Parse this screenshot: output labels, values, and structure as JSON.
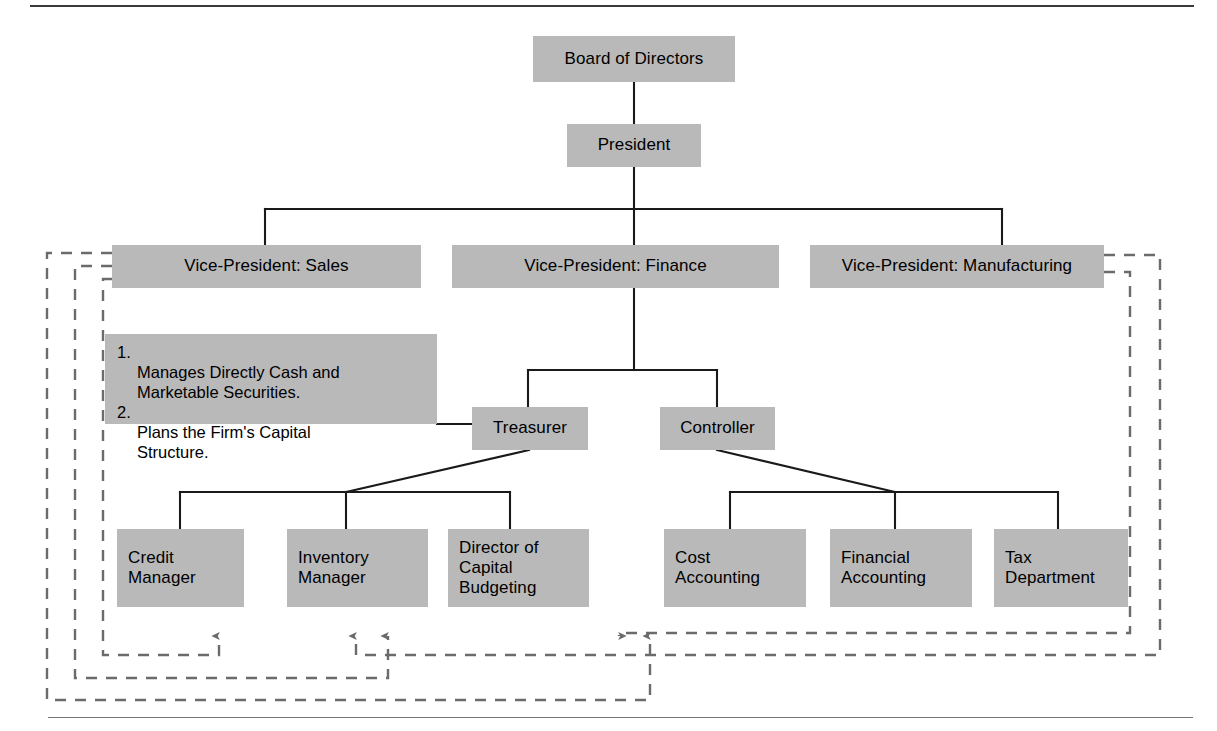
{
  "figure": {
    "kind": "organization-chart",
    "box_fill": "#b9b9b9",
    "line_color": "#1a1a1a",
    "dashed_color": "#6b6b6b",
    "rule_color": "#767676"
  },
  "nodes": {
    "board": "Board of Directors",
    "president": "President",
    "vp_sales": "Vice-President: Sales",
    "vp_finance": "Vice-President: Finance",
    "vp_manufacturing": "Vice-President: Manufacturing",
    "treasurer": "Treasurer",
    "controller": "Controller",
    "credit_manager": "Credit\nManager",
    "inventory_manager": "Inventory\nManager",
    "capital_budgeting": "Director of\nCapital\nBudgeting",
    "cost_accounting": "Cost\nAccounting",
    "financial_accounting": "Financial\nAccounting",
    "tax_department": "Tax\nDepartment"
  },
  "note": {
    "items": [
      {
        "num": "1.",
        "text": "Manages Directly Cash and\nMarketable Securities."
      },
      {
        "num": "2.",
        "text": "Plans the Firm's Capital\nStructure."
      }
    ]
  },
  "hierarchy": {
    "board": [
      "president"
    ],
    "president": [
      "vp_sales",
      "vp_finance",
      "vp_manufacturing"
    ],
    "vp_finance": [
      "treasurer",
      "controller"
    ],
    "treasurer": [
      "credit_manager",
      "inventory_manager",
      "capital_budgeting"
    ],
    "controller": [
      "cost_accounting",
      "financial_accounting",
      "tax_department"
    ]
  },
  "dashed_flows": [
    {
      "from": "vp_sales",
      "to": "credit_manager"
    },
    {
      "from": "vp_sales",
      "to": "inventory_manager"
    },
    {
      "from": "vp_sales",
      "to": "capital_budgeting"
    },
    {
      "from": "vp_manufacturing",
      "to": "inventory_manager"
    },
    {
      "from": "vp_manufacturing",
      "to": "capital_budgeting"
    }
  ]
}
